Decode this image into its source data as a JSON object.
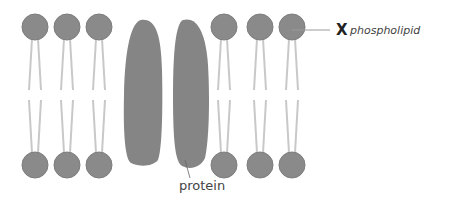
{
  "diagram": {
    "labels": {
      "marker": "X",
      "phospholipid": "phospholipid",
      "protein": "protein"
    },
    "colors": {
      "head": "#8a8a8a",
      "head_stroke": "#7a7a7a",
      "tail": "#c4c4c4",
      "protein": "#858585",
      "leader_line": "#9a9a9a"
    },
    "phospholipid_columns_x": [
      35,
      67,
      99,
      224,
      260,
      292
    ],
    "head_top_y": 27,
    "head_bottom_y": 165,
    "head_radius": 13,
    "proteins": [
      {
        "name": "protein-left",
        "cx": 145,
        "cy": 98
      },
      {
        "name": "protein-right",
        "cx": 193,
        "cy": 98
      }
    ]
  }
}
